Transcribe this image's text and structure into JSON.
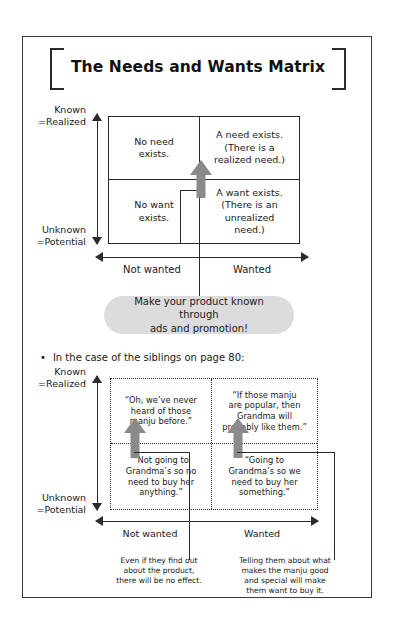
{
  "title": "The Needs and Wants Matrix",
  "top_matrix": {
    "y_axis": {
      "top_label": "Known\n=Realized",
      "bottom_label": "Unknown\n=Potential"
    },
    "x_axis": {
      "left_label": "Not wanted",
      "right_label": "Wanted"
    },
    "quadrants": {
      "top_left": "No need\nexists.",
      "top_right": "A need exists.\n(There is a\nrealized need.)",
      "bottom_left": "No want\nexists.",
      "bottom_right": "A want exists.\n(There is an\nunrealized\nneed.)"
    }
  },
  "callout": "Make your product known through\nads and promotion!",
  "section_bullet": {
    "dot": "•",
    "text": "In the case of the siblings on page 80:"
  },
  "bottom_matrix": {
    "y_axis": {
      "top_label": "Known\n=Realized",
      "bottom_label": "Unknown\n=Potential"
    },
    "x_axis": {
      "left_label": "Not wanted",
      "right_label": "Wanted"
    },
    "quadrants": {
      "top_left": "“Oh, we’ve never\nheard of those\nmanju before.”",
      "top_right": "“If those manju\nare popular, then\nGrandma will\nprobably like them.”",
      "bottom_left": "“Not going to\nGrandma’s so no\nneed to buy her\nanything.”",
      "bottom_right": "“Going to\nGrandma’s so we\nneed to buy her\nsomething.”"
    },
    "notes": {
      "left": "Even if they find out\nabout the product,\nthere will be no effect.",
      "right": "Telling them about what\nmakes the manju good\nand special will make\nthem want to buy it."
    }
  },
  "colors": {
    "ink": "#2b2b2b",
    "arrow_gray": "#8a8a8a",
    "bubble_gray": "#dcdcdc"
  }
}
